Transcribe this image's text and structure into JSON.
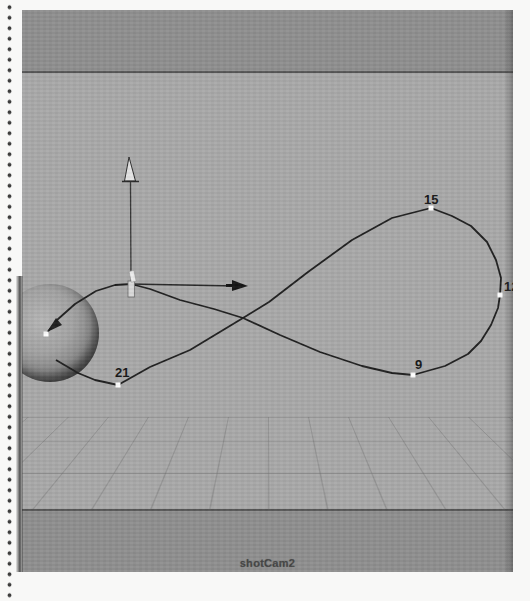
{
  "figure": {
    "camera_label": "shotCam2",
    "keyframes": [
      {
        "label": "15"
      },
      {
        "label": "12"
      },
      {
        "label": "9"
      },
      {
        "label": "21"
      }
    ],
    "manipulator": {
      "y_axis_icon": "up-arrow-icon",
      "x_axis_icon": "right-arrow-icon",
      "center_icon": "move-handle-icon"
    },
    "path_end_icon": "path-direction-arrow-icon",
    "colors": {
      "band": "#8f8f8f",
      "viewport_bg": "#a9a9a9",
      "separator": "#565656",
      "path": "#1f1f1f",
      "marker": "#ffffff",
      "label_text": "#161616"
    }
  }
}
